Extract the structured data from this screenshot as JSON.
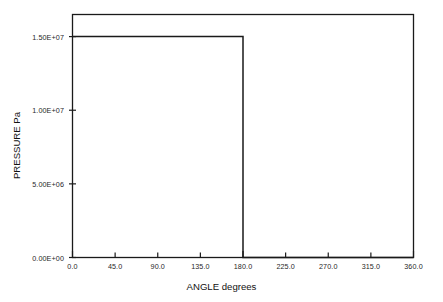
{
  "chart_data": {
    "type": "line",
    "title": "",
    "xlabel": "ANGLE degrees",
    "ylabel": "PRESSURE Pa",
    "xlim": [
      0.0,
      360.0
    ],
    "ylim": [
      0.0,
      16500000.0
    ],
    "grid": false,
    "legend": null,
    "xticks": [
      0.0,
      45.0,
      90.0,
      135.0,
      180.0,
      225.0,
      270.0,
      315.0,
      360.0
    ],
    "xtick_labels": [
      "0.0",
      "45.0",
      "90.0",
      "135.0",
      "180.0",
      "225.0",
      "270.0",
      "315.0",
      "360.0"
    ],
    "yticks": [
      0.0,
      5000000.0,
      10000000.0,
      15000000.0
    ],
    "ytick_labels": [
      "0.00E+00",
      "5.00E+06",
      "1.00E+07",
      "1.50E+07"
    ],
    "series": [
      {
        "name": "pressure",
        "color": "#1a1a1a",
        "x": [
          0.0,
          180.0,
          180.0,
          360.0
        ],
        "values": [
          15000000.0,
          15000000.0,
          0.0,
          0.0
        ]
      }
    ]
  },
  "axes": {
    "x_title": "ANGLE degrees",
    "y_title": "PRESSURE Pa",
    "frame_color": "#1a1a1a"
  }
}
